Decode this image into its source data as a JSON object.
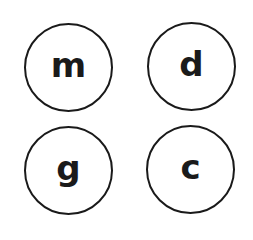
{
  "keys": [
    {
      "label": "m"
    },
    {
      "label": "d"
    },
    {
      "label": "g"
    },
    {
      "label": "c"
    }
  ],
  "colors": {
    "stroke": "#1a1a1a",
    "background": "#ffffff"
  }
}
